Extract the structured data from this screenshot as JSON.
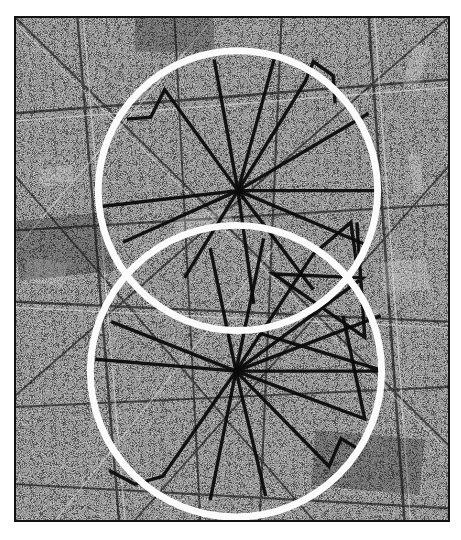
{
  "figure": {
    "title": "Two overlapping survey circles on a high-contrast city street map",
    "caption": "",
    "kind": "annotated-map-figure",
    "background_color": "#ffffff",
    "map_area": {
      "x": 14,
      "y": 16,
      "width": 436,
      "height": 506,
      "border_color": "#15110e",
      "border_width": 2,
      "base_tone": "#3a3a3a",
      "texture": "halftone dithered black-and-white aerial street grid"
    },
    "palette": {
      "map_dark": "#111111",
      "map_light": "#f2f2f2",
      "map_mid": "#7d7d7d",
      "circle_stroke": "#fbfbfb",
      "ray_stroke": "#0b0b0b",
      "page_background": "#ffffff",
      "frame_border": "#15110e"
    }
  },
  "circles": [
    {
      "id": "upper-circle",
      "label": "upper circle",
      "cx": 224,
      "cy": 174,
      "r": 141,
      "stroke": "#fbfbfb",
      "stroke_width": 7
    },
    {
      "id": "lower-circle",
      "label": "lower circle",
      "cx": 222,
      "cy": 356,
      "r": 147,
      "stroke": "#fbfbfb",
      "stroke_width": 7
    }
  ],
  "hubs": [
    {
      "id": "upper-hub",
      "cx": 224,
      "cy": 174,
      "label": "upper hub node"
    },
    {
      "id": "lower-hub",
      "cx": 222,
      "cy": 356,
      "label": "lower hub node"
    }
  ],
  "rays": {
    "stroke": "#0b0b0b",
    "stroke_width": 3.4,
    "upper": [
      [
        [
          224,
          174
        ],
        [
          150,
          72
        ],
        [
          136,
          100
        ],
        [
          112,
          102
        ]
      ],
      [
        [
          224,
          174
        ],
        [
          200,
          42
        ]
      ],
      [
        [
          224,
          174
        ],
        [
          262,
          36
        ]
      ],
      [
        [
          224,
          174
        ],
        [
          292,
          64
        ],
        [
          300,
          44
        ],
        [
          320,
          58
        ],
        [
          322,
          86
        ]
      ],
      [
        [
          224,
          174
        ],
        [
          356,
          96
        ]
      ],
      [
        [
          224,
          174
        ],
        [
          362,
          174
        ]
      ],
      [
        [
          224,
          174
        ],
        [
          352,
          228
        ]
      ],
      [
        [
          224,
          174
        ],
        [
          300,
          274
        ]
      ],
      [
        [
          224,
          174
        ],
        [
          240,
          288
        ]
      ],
      [
        [
          224,
          174
        ],
        [
          170,
          262
        ]
      ],
      [
        [
          224,
          174
        ],
        [
          108,
          226
        ]
      ],
      [
        [
          224,
          174
        ],
        [
          86,
          190
        ]
      ]
    ],
    "lower": [
      [
        [
          222,
          356
        ],
        [
          196,
          232
        ]
      ],
      [
        [
          222,
          356
        ],
        [
          250,
          222
        ]
      ],
      [
        [
          222,
          356
        ],
        [
          300,
          238
        ],
        [
          338,
          206
        ],
        [
          344,
          250
        ]
      ],
      [
        [
          222,
          356
        ],
        [
          350,
          262
        ],
        [
          260,
          258
        ],
        [
          352,
          322
        ],
        [
          344,
          206
        ]
      ],
      [
        [
          222,
          356
        ],
        [
          368,
          300
        ]
      ],
      [
        [
          222,
          356
        ],
        [
          372,
          356
        ],
        [
          246,
          318
        ]
      ],
      [
        [
          222,
          356
        ],
        [
          352,
          404
        ],
        [
          330,
          300
        ]
      ],
      [
        [
          222,
          356
        ],
        [
          316,
          452
        ],
        [
          328,
          424
        ],
        [
          348,
          436
        ]
      ],
      [
        [
          222,
          356
        ],
        [
          252,
          482
        ]
      ],
      [
        [
          222,
          356
        ],
        [
          196,
          486
        ]
      ],
      [
        [
          222,
          356
        ],
        [
          148,
          462
        ],
        [
          120,
          470
        ],
        [
          94,
          456
        ]
      ],
      [
        [
          222,
          356
        ],
        [
          96,
          306
        ]
      ],
      [
        [
          222,
          356
        ],
        [
          80,
          344
        ]
      ]
    ]
  },
  "annotations": {
    "axis_labels": [],
    "legend": [],
    "text_items": []
  }
}
